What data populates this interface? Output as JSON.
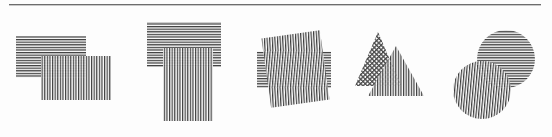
{
  "page": {
    "background_color": "#fdfdfd",
    "width": 552,
    "height": 137
  },
  "rule": {
    "name": "horizontal-rule",
    "x": 9,
    "y": 4,
    "width": 532,
    "color": "#6d6d6d"
  },
  "palette": {
    "hatch_line": "#3a3a3a",
    "hatch_light": "#555555",
    "overlap_dark": "#1a1a1a",
    "paper": "#fdfdfd"
  },
  "figures": [
    {
      "id": "figure-1",
      "label": "two overlapping rectangles",
      "shapes": [
        {
          "name": "rect-horizontal-hatch",
          "type": "rect",
          "x": 16,
          "y": 36,
          "width": 70,
          "height": 42,
          "hatch": "horizontal"
        },
        {
          "name": "rect-vertical-hatch",
          "type": "rect",
          "x": 41,
          "y": 56,
          "width": 70,
          "height": 44,
          "hatch": "vertical"
        }
      ]
    },
    {
      "id": "figure-2",
      "label": "T-shaped overlapping rectangles",
      "shapes": [
        {
          "name": "rect-horizontal-hatch",
          "type": "rect",
          "x": 147,
          "y": 22,
          "width": 74,
          "height": 45,
          "hatch": "horizontal"
        },
        {
          "name": "rect-vertical-hatch",
          "type": "rect",
          "x": 163,
          "y": 48,
          "width": 50,
          "height": 73,
          "hatch": "vertical"
        }
      ]
    },
    {
      "id": "figure-3",
      "label": "rectangle overlapping a rotated rectangle",
      "shapes": [
        {
          "name": "rect-horizontal-hatch",
          "type": "rect",
          "x": 257,
          "y": 51,
          "width": 74,
          "height": 37,
          "hatch": "horizontal"
        },
        {
          "name": "rect-vertical-hatch-rotated",
          "type": "rect",
          "x": 266,
          "y": 34,
          "width": 59,
          "height": 70,
          "rotation": -8,
          "hatch": "vertical"
        }
      ]
    },
    {
      "id": "figure-4",
      "label": "two overlapping triangles",
      "shapes": [
        {
          "name": "triangle-diagonal-hatch",
          "type": "triangle",
          "points": "378,32 401,86 355,86",
          "hatch": "diagonal"
        },
        {
          "name": "triangle-vertical-hatch",
          "type": "triangle",
          "points": "396,46 424,96 368,96",
          "hatch": "vertical"
        }
      ]
    },
    {
      "id": "figure-5",
      "label": "two overlapping circles",
      "shapes": [
        {
          "name": "circle-horizontal-hatch",
          "type": "circle",
          "cx": 506,
          "cy": 59,
          "r": 29,
          "hatch": "horizontal"
        },
        {
          "name": "circle-vertical-hatch",
          "type": "circle",
          "cx": 482,
          "cy": 90,
          "r": 29,
          "hatch": "vertical"
        }
      ]
    }
  ]
}
